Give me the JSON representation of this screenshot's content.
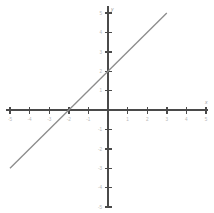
{
  "chart_data": {
    "type": "line",
    "title": "",
    "subtitle": "",
    "xlabel": "x",
    "ylabel": "y",
    "xlim": [
      -5,
      5
    ],
    "ylim": [
      -5,
      5
    ],
    "grid": false,
    "legend": null,
    "x_ticks": [
      -5,
      -4,
      -3,
      -2,
      -1,
      1,
      2,
      3,
      4,
      5
    ],
    "y_ticks": [
      -5,
      -4,
      -3,
      -2,
      -1,
      1,
      2,
      3,
      4,
      5
    ],
    "x_tick_labels": [
      "-5",
      "-4",
      "-3",
      "-2",
      "-1",
      "1",
      "2",
      "3",
      "4",
      "5"
    ],
    "y_tick_labels": [
      "-5",
      "-4",
      "-3",
      "-2",
      "-1",
      "1",
      "2",
      "3",
      "4",
      "5"
    ],
    "series": [
      {
        "name": "y = x + 2",
        "equation": "y = x + 2",
        "slope": 1,
        "y_intercept": 2,
        "x_intercept": -2,
        "color": "#8c8c8c",
        "x": [
          -5,
          3
        ],
        "values": [
          -3,
          5
        ],
        "points": [
          {
            "x": -5,
            "y": -3
          },
          {
            "x": -2,
            "y": 0
          },
          {
            "x": 0,
            "y": 2
          },
          {
            "x": 3,
            "y": 5
          }
        ]
      }
    ],
    "axis_color": "#4a4a4a",
    "background": "#ffffff"
  },
  "axes": {
    "x_axis_label": "x",
    "y_axis_label": "y"
  }
}
